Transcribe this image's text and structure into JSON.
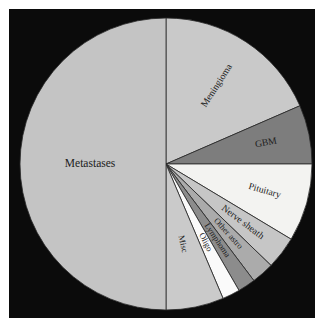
{
  "figure": {
    "background_color": "#0b0b0b",
    "frame_color": "#0b0b0b",
    "outline_color": "#2a2a2a"
  },
  "chart_data": {
    "type": "pie",
    "title": "",
    "subtitle": "",
    "xlabel": "",
    "ylabel": "",
    "legend_position": "none",
    "grid": false,
    "labels_placement": "inside-slice-rotated",
    "start_angle_deg_from_north": 0,
    "direction": "clockwise",
    "categories": [
      "Meningioma",
      "GBM",
      "Pituitary",
      "Nerve sheath",
      "Other astro",
      "Lymphoma",
      "Oligo",
      "Misc",
      "Metastases"
    ],
    "values": [
      18.5,
      6.5,
      8.6,
      3.6,
      2.5,
      1.9,
      1.9,
      6.5,
      50.0
    ],
    "units": "percent",
    "slices": [
      {
        "label": "Meningioma",
        "value": 18.5,
        "start_deg": 0.0,
        "end_deg": 66.5,
        "color": "#c9c9c9",
        "label_size": "med",
        "label_radius": 0.64,
        "label_rotation": -57
      },
      {
        "label": "GBM",
        "value": 6.5,
        "start_deg": 66.5,
        "end_deg": 90.0,
        "color": "#7d7d7d",
        "label_size": "med",
        "label_radius": 0.7,
        "label_rotation": -11
      },
      {
        "label": "Pituitary",
        "value": 8.6,
        "start_deg": 90.0,
        "end_deg": 121.0,
        "color": "#f3f3f1",
        "label_size": "med",
        "label_radius": 0.7,
        "label_rotation": 16
      },
      {
        "label": "Nerve sheath",
        "value": 3.6,
        "start_deg": 121.0,
        "end_deg": 134.0,
        "color": "#c6c6c6",
        "label_size": "med",
        "label_radius": 0.66,
        "label_rotation": 37
      },
      {
        "label": "Other astro",
        "value": 2.5,
        "start_deg": 134.0,
        "end_deg": 143.0,
        "color": "#ababab",
        "label_size": "sm",
        "label_radius": 0.64,
        "label_rotation": 48
      },
      {
        "label": "Lymphoma",
        "value": 1.9,
        "start_deg": 143.0,
        "end_deg": 150.0,
        "color": "#8c8c8c",
        "label_size": "sm",
        "label_radius": 0.63,
        "label_rotation": 56
      },
      {
        "label": "Oligo",
        "value": 1.9,
        "start_deg": 150.0,
        "end_deg": 157.0,
        "color": "#fafafa",
        "label_size": "sm",
        "label_radius": 0.6,
        "label_rotation": 63
      },
      {
        "label": "Misc",
        "value": 6.5,
        "start_deg": 157.0,
        "end_deg": 180.0,
        "color": "#cacaca",
        "label_size": "sm",
        "label_radius": 0.56,
        "label_rotation": 78
      },
      {
        "label": "Metastases",
        "value": 50.0,
        "start_deg": 180.0,
        "end_deg": 360.0,
        "color": "#c4c4c4",
        "label_size": "big",
        "label_radius": 0.52,
        "label_rotation": 0
      }
    ],
    "geometry": {
      "center_x": 157,
      "center_y": 155,
      "radius": 146
    }
  }
}
